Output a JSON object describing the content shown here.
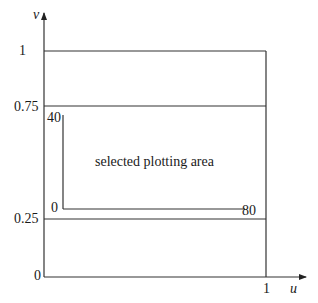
{
  "diagram": {
    "title": "",
    "axes": {
      "x_label": "u",
      "y_label": "v",
      "x_ticks": [
        {
          "label": "1",
          "value": 1
        }
      ],
      "y_ticks": [
        {
          "label": "1",
          "value": 1
        },
        {
          "label": "0.75",
          "value": 0.75
        },
        {
          "label": "0.25",
          "value": 0.25
        },
        {
          "label": "0",
          "value": 0
        }
      ]
    },
    "unit_square": {
      "u_range": [
        0,
        1
      ],
      "v_range": [
        0,
        1
      ]
    },
    "band_lines": {
      "upper_v": "0.75",
      "lower_v": "0.25"
    },
    "selected_area": {
      "label": "selected plotting area",
      "corner_labels": {
        "top_left": "40",
        "bottom_left": "0",
        "bottom_right": "80"
      }
    },
    "colors": {
      "line": "#333333",
      "background": "#ffffff",
      "text": "#1a1a1a"
    }
  }
}
